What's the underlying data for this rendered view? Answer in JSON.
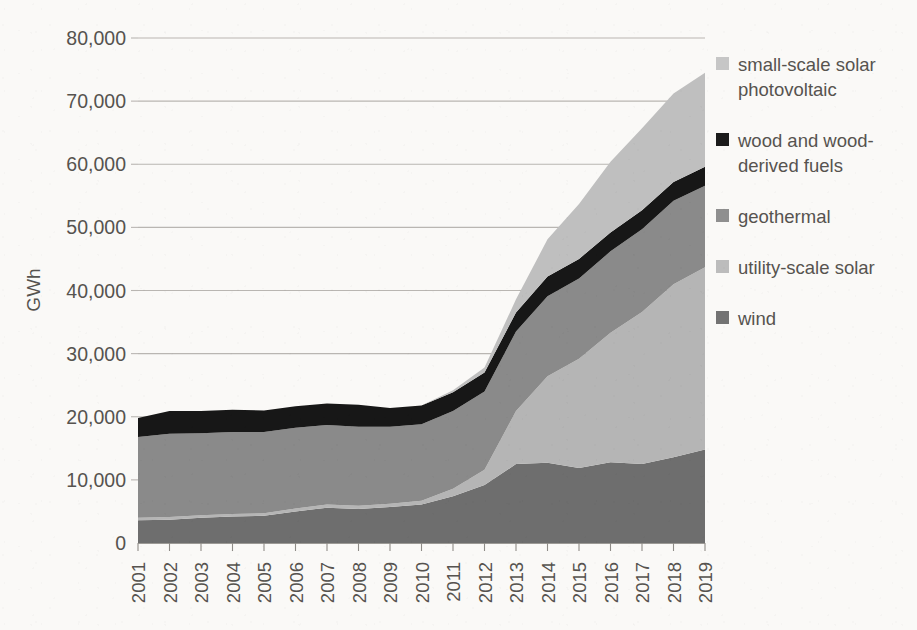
{
  "chart_data": {
    "type": "area",
    "stacked": true,
    "title": "",
    "xlabel": "",
    "ylabel": "GWh",
    "grid": true,
    "legend_position": "right",
    "x": [
      2001,
      2002,
      2003,
      2004,
      2005,
      2006,
      2007,
      2008,
      2009,
      2010,
      2011,
      2012,
      2013,
      2014,
      2015,
      2016,
      2017,
      2018,
      2019
    ],
    "categories": [
      "2001",
      "2002",
      "2003",
      "2004",
      "2005",
      "2006",
      "2007",
      "2008",
      "2009",
      "2010",
      "2011",
      "2012",
      "2013",
      "2014",
      "2015",
      "2016",
      "2017",
      "2018",
      "2019"
    ],
    "ylim": [
      0,
      80000
    ],
    "yticks": [
      0,
      10000,
      20000,
      30000,
      40000,
      50000,
      60000,
      70000,
      80000
    ],
    "ytick_labels": [
      "0",
      "10,000",
      "20,000",
      "30,000",
      "40,000",
      "50,000",
      "60,000",
      "70,000",
      "80,000"
    ],
    "stack_order_bottom_to_top": [
      "wind",
      "utility-scale solar",
      "geothermal",
      "wood and wood-derived fuels",
      "small-scale solar photovoltaic"
    ],
    "series": [
      {
        "name": "wind",
        "color": "#6e6e6e",
        "values": [
          3600,
          3700,
          4000,
          4200,
          4300,
          5000,
          5600,
          5400,
          5700,
          6100,
          7400,
          9200,
          12500,
          12700,
          11900,
          12800,
          12500,
          13600,
          14800
        ]
      },
      {
        "name": "utility-scale solar",
        "color": "#b5b5b5",
        "values": [
          400,
          400,
          400,
          400,
          400,
          450,
          500,
          500,
          500,
          600,
          1200,
          2400,
          8400,
          13700,
          17300,
          20500,
          24100,
          27400,
          28900
        ]
      },
      {
        "name": "geothermal",
        "color": "#8a8a8a",
        "values": [
          12800,
          13200,
          13000,
          13000,
          12900,
          12800,
          12600,
          12500,
          12200,
          12100,
          12300,
          12400,
          12600,
          12700,
          12700,
          12900,
          13100,
          13200,
          12900
        ]
      },
      {
        "name": "wood and wood-derived fuels",
        "color": "#171717",
        "values": [
          3000,
          3600,
          3500,
          3500,
          3400,
          3400,
          3400,
          3500,
          3000,
          3000,
          3000,
          3000,
          3000,
          3100,
          3100,
          3000,
          3000,
          3000,
          3000
        ]
      },
      {
        "name": "small-scale solar photovoltaic",
        "color": "#bfbfbf",
        "values": [
          0,
          0,
          0,
          0,
          0,
          0,
          0,
          0,
          0,
          0,
          300,
          800,
          2100,
          5900,
          8700,
          11200,
          13000,
          14000,
          14900
        ]
      }
    ],
    "totals": [
      19800,
      20900,
      20900,
      21100,
      21000,
      21650,
      22100,
      21900,
      21400,
      21800,
      24200,
      27800,
      38600,
      48100,
      53700,
      60400,
      65700,
      71200,
      74500
    ]
  },
  "axis": {
    "y_title": "GWh"
  },
  "legend": {
    "items": [
      {
        "label": "small-scale solar photovoltaic",
        "color": "#c6c6c6",
        "name": "small-scale-solar-photovoltaic"
      },
      {
        "label": "wood and wood-derived fuels",
        "color": "#1b1b1b",
        "name": "wood-and-wood-derived-fuels"
      },
      {
        "label": "geothermal",
        "color": "#8f8f8f",
        "name": "geothermal"
      },
      {
        "label": "utility-scale solar",
        "color": "#bcbcbc",
        "name": "utility-scale-solar"
      },
      {
        "label": "wind",
        "color": "#737373",
        "name": "wind"
      }
    ]
  }
}
